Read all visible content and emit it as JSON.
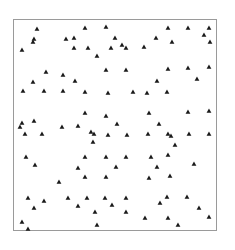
{
  "chart_data": {
    "type": "scatter",
    "title": "",
    "xlabel": "",
    "ylabel": "",
    "grid": false,
    "legend": null,
    "marker": "triangle",
    "marker_color": "#1a1a1a",
    "frame_color": "#9a9a9a",
    "frame": {
      "x": 13,
      "y": 19,
      "width": 204,
      "height": 212
    },
    "points": [
      [
        37,
        29
      ],
      [
        85,
        28
      ],
      [
        106,
        27
      ],
      [
        168,
        28
      ],
      [
        188,
        28
      ],
      [
        209,
        28
      ],
      [
        34,
        39
      ],
      [
        33,
        42
      ],
      [
        66,
        39
      ],
      [
        74,
        38
      ],
      [
        115,
        38
      ],
      [
        156,
        38
      ],
      [
        172,
        42
      ],
      [
        204,
        35
      ],
      [
        210,
        42
      ],
      [
        22,
        50
      ],
      [
        74,
        48
      ],
      [
        88,
        48
      ],
      [
        111,
        48
      ],
      [
        122,
        45
      ],
      [
        126,
        48
      ],
      [
        144,
        47
      ],
      [
        97,
        56
      ],
      [
        46,
        72
      ],
      [
        63,
        75
      ],
      [
        106,
        70
      ],
      [
        126,
        70
      ],
      [
        168,
        69
      ],
      [
        188,
        68
      ],
      [
        209,
        67
      ],
      [
        33,
        82
      ],
      [
        75,
        81
      ],
      [
        157,
        81
      ],
      [
        197,
        79
      ],
      [
        23,
        91
      ],
      [
        44,
        91
      ],
      [
        63,
        91
      ],
      [
        85,
        92
      ],
      [
        108,
        93
      ],
      [
        133,
        92
      ],
      [
        147,
        93
      ],
      [
        167,
        92
      ],
      [
        85,
        113
      ],
      [
        106,
        116
      ],
      [
        149,
        113
      ],
      [
        188,
        112
      ],
      [
        209,
        111
      ],
      [
        34,
        121
      ],
      [
        22,
        123
      ],
      [
        20,
        127
      ],
      [
        62,
        127
      ],
      [
        78,
        126
      ],
      [
        117,
        124
      ],
      [
        159,
        124
      ],
      [
        25,
        134
      ],
      [
        42,
        134
      ],
      [
        91,
        132
      ],
      [
        94,
        134
      ],
      [
        108,
        135
      ],
      [
        127,
        135
      ],
      [
        148,
        134
      ],
      [
        168,
        134
      ],
      [
        171,
        136
      ],
      [
        189,
        134
      ],
      [
        209,
        134
      ],
      [
        93,
        142
      ],
      [
        175,
        145
      ],
      [
        168,
        155
      ],
      [
        26,
        157
      ],
      [
        85,
        157
      ],
      [
        106,
        157
      ],
      [
        126,
        157
      ],
      [
        151,
        157
      ],
      [
        35,
        165
      ],
      [
        78,
        168
      ],
      [
        116,
        167
      ],
      [
        157,
        167
      ],
      [
        194,
        164
      ],
      [
        85,
        177
      ],
      [
        106,
        177
      ],
      [
        149,
        178
      ],
      [
        170,
        176
      ],
      [
        59,
        182
      ],
      [
        28,
        198
      ],
      [
        68,
        198
      ],
      [
        87,
        198
      ],
      [
        105,
        198
      ],
      [
        126,
        198
      ],
      [
        167,
        197
      ],
      [
        187,
        197
      ],
      [
        44,
        201
      ],
      [
        160,
        203
      ],
      [
        34,
        208
      ],
      [
        78,
        206
      ],
      [
        112,
        205
      ],
      [
        199,
        208
      ],
      [
        95,
        212
      ],
      [
        126,
        212
      ],
      [
        145,
        218
      ],
      [
        168,
        218
      ],
      [
        209,
        217
      ],
      [
        22,
        222
      ],
      [
        97,
        225
      ],
      [
        178,
        225
      ],
      [
        28,
        229
      ]
    ]
  }
}
